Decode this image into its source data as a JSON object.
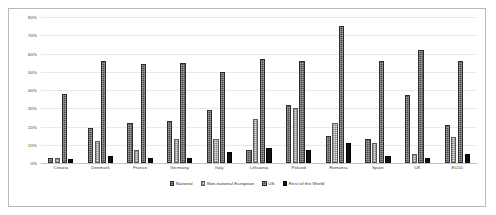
{
  "chart_data": {
    "type": "bar",
    "title": "",
    "subtitle": "",
    "xlabel": "",
    "ylabel": "",
    "ylim": [
      0,
      80
    ],
    "ytick_labels": [
      "80%",
      "70%",
      "60%",
      "50%",
      "40%",
      "30%",
      "20%",
      "10%",
      "0%"
    ],
    "ytick_values": [
      80,
      70,
      60,
      50,
      40,
      30,
      20,
      10,
      0
    ],
    "grid": true,
    "legend_position": "bottom",
    "categories": [
      "Croatia",
      "Denmark",
      "France",
      "Germany",
      "Italy",
      "Lithuania",
      "Poland",
      "Romania",
      "Spain",
      "UK",
      "EU10"
    ],
    "series": [
      {
        "name": "National",
        "values": [
          3,
          19,
          22,
          23,
          29,
          7,
          32,
          15,
          13,
          37,
          21
        ]
      },
      {
        "name": "Non-national European",
        "values": [
          3,
          12,
          7,
          13,
          13,
          24,
          30,
          22,
          11,
          5,
          14
        ]
      },
      {
        "name": "US",
        "values": [
          38,
          56,
          54,
          55,
          50,
          57,
          56,
          75,
          56,
          62,
          56
        ]
      },
      {
        "name": "Rest of the World",
        "values": [
          2,
          4,
          3,
          3,
          6,
          8,
          7,
          11,
          4,
          3,
          5
        ]
      }
    ]
  },
  "colors": {
    "series_national": "#4a4a4a",
    "series_non_national_european": "#e3e3e3",
    "series_us": "#4a4a4a",
    "series_rest_of_world": "#111111",
    "grid": "#e9e9e9",
    "axis": "#c3c3c3",
    "frame": "#b9b9b9",
    "text": "#3b3b3b",
    "background": "#ffffff"
  }
}
